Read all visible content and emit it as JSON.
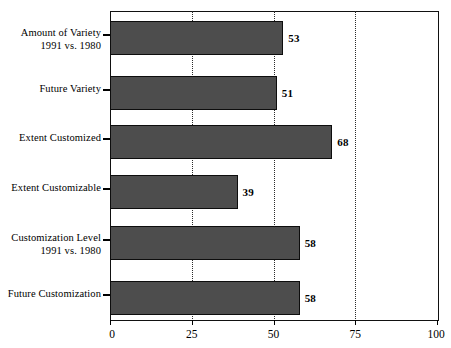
{
  "chart_data": {
    "type": "bar",
    "orientation": "horizontal",
    "title": "",
    "subtitle": "",
    "xlabel": "",
    "ylabel": "",
    "xlim": [
      0,
      100
    ],
    "xticks": [
      "0",
      "25",
      "50",
      "75",
      "100"
    ],
    "xtick_values": [
      0,
      25,
      50,
      75,
      100
    ],
    "gridlines": [
      25,
      50,
      75
    ],
    "grid": true,
    "legend": "none",
    "bar_color": "#4d4d4d",
    "bar_edge_color": "#0d0d0d",
    "background_color": "#ffffff",
    "categories": [
      "Amount of Variety\n1991 vs. 1980",
      "Future Variety",
      "Extent Customized",
      "Extent Customizable",
      "Customization Level\n1991 vs. 1980",
      "Future Customization"
    ],
    "values": [
      53,
      51,
      68,
      39,
      58,
      58
    ],
    "value_labels": [
      "53",
      "51",
      "68",
      "39",
      "58",
      "58"
    ]
  }
}
